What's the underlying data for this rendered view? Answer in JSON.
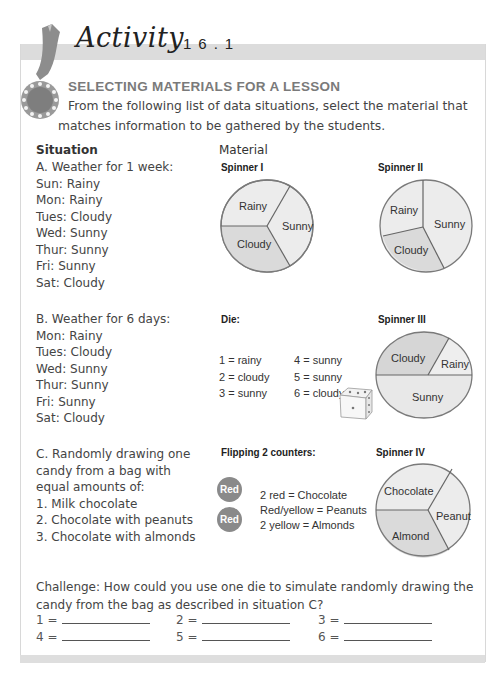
{
  "header": {
    "activity_word": "Activity",
    "activity_number": "16.1",
    "title": "SELECTING MATERIALS FOR A LESSON",
    "intro": "From the following list of data situations, select the material that matches information to be gathered by the students."
  },
  "columns": {
    "situation": "Situation",
    "material": "Material"
  },
  "situations": {
    "a": {
      "title": "A. Weather for 1 week:",
      "lines": [
        "Sun: Rainy",
        "Mon: Rainy",
        "Tues: Cloudy",
        "Wed: Sunny",
        "Thur: Sunny",
        "Fri: Sunny",
        "Sat: Cloudy"
      ]
    },
    "b": {
      "title": "B. Weather for 6 days:",
      "lines": [
        "Mon: Rainy",
        "Tues: Cloudy",
        "Wed: Sunny",
        "Thur: Sunny",
        "Fri: Sunny",
        "Sat: Cloudy"
      ]
    },
    "c": {
      "title": "C. Randomly drawing one candy from a bag with equal amounts of:",
      "lines": [
        "1. Milk chocolate",
        "2. Chocolate with peanuts",
        "3. Chocolate with almonds"
      ]
    }
  },
  "materials": {
    "spinner1": {
      "label": "Spinner I",
      "sections": [
        "Rainy",
        "Sunny",
        "Cloudy"
      ]
    },
    "spinner2": {
      "label": "Spinner II",
      "sections": [
        "Rainy",
        "Sunny",
        "Cloudy"
      ]
    },
    "spinner3": {
      "label": "Spinner III",
      "sections": [
        "Cloudy",
        "Rainy",
        "Sunny"
      ]
    },
    "spinner4": {
      "label": "Spinner IV",
      "sections": [
        "Chocolate",
        "Peanut",
        "Almond"
      ]
    },
    "die": {
      "label": "Die:",
      "mapping": [
        [
          "1 = rainy",
          "4 = sunny"
        ],
        [
          "2 = cloudy",
          "5 = sunny"
        ],
        [
          "3 = sunny",
          "6 = cloudy"
        ]
      ]
    },
    "counters": {
      "label": "Flipping 2 counters:",
      "chips": [
        "Red",
        "Red"
      ],
      "rules": [
        "2 red = Chocolate",
        "Red/yellow = Peanuts",
        "2 yellow = Almonds"
      ]
    }
  },
  "challenge": {
    "text": "Challenge: How could you use one die to simulate randomly drawing the candy from the bag as described in situation C?",
    "answers": [
      "1 =",
      "2 =",
      "3 =",
      "4 =",
      "5 =",
      "6 ="
    ]
  },
  "colors": {
    "band": "#dcdcdc",
    "slice_light": "#ececec",
    "slice_dark": "#dadada",
    "counter": "#8a8a8a"
  }
}
